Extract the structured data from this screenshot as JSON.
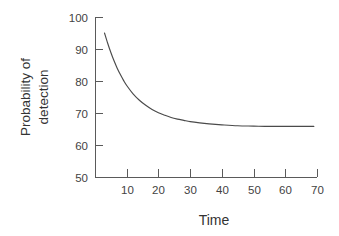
{
  "chart_data": {
    "type": "line",
    "title": "",
    "xlabel": "Time",
    "ylabel": "Probability of detection",
    "ylabel_lines": [
      "Probability of",
      "detection"
    ],
    "xlim": [
      0,
      70
    ],
    "ylim": [
      50,
      100
    ],
    "xticks": [
      10,
      20,
      30,
      40,
      50,
      60,
      70
    ],
    "yticks": [
      50,
      60,
      70,
      80,
      90,
      100
    ],
    "xtick_labels": [
      "10",
      "20",
      "30",
      "40",
      "50",
      "60",
      "70"
    ],
    "ytick_labels": [
      "50",
      "60",
      "70",
      "80",
      "90",
      "100"
    ],
    "grid": false,
    "legend": "none",
    "series": [
      {
        "name": "Probability of detection",
        "color": "#4a4a4a",
        "x": [
          3,
          4,
          5,
          6,
          7,
          8,
          9,
          10,
          12,
          14,
          16,
          18,
          20,
          22,
          24,
          26,
          28,
          30,
          33,
          36,
          40,
          45,
          50,
          55,
          60,
          65,
          69
        ],
        "y": [
          95.0,
          91.8,
          88.9,
          86.3,
          84.0,
          82.0,
          80.2,
          78.6,
          76.0,
          74.0,
          72.4,
          71.1,
          70.1,
          69.3,
          68.6,
          68.1,
          67.7,
          67.3,
          66.9,
          66.6,
          66.3,
          66.0,
          65.9,
          65.8,
          65.8,
          65.8,
          65.8
        ]
      }
    ],
    "asymptote": 65.8,
    "start_point": {
      "x": 3,
      "y": 95.0
    },
    "end_point": {
      "x": 69,
      "y": 65.8
    },
    "axis_color": "#5a5a5a",
    "background_color": "#ffffff"
  },
  "geometry": {
    "plot_left_px": 95,
    "plot_right_px": 317,
    "plot_top_px": 17,
    "plot_bottom_px": 177
  }
}
